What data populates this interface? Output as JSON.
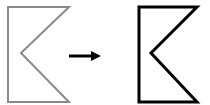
{
  "diagram": {
    "shapes": [
      {
        "id": "source-shape",
        "stroke": "#8a8a8a",
        "stroke_width": 2,
        "points": "8,7 69,7 21,53 69,102 8,102"
      },
      {
        "id": "target-shape",
        "stroke": "#000000",
        "stroke_width": 3,
        "points": "139,7 197,7 151,53 197,102 139,102"
      }
    ],
    "arrow": {
      "x1": 69,
      "y1": 56,
      "x2": 101,
      "y2": 56,
      "color": "#000000"
    }
  }
}
